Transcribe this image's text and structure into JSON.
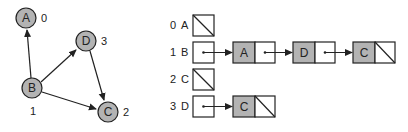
{
  "graph": {
    "nodes": [
      {
        "id": "A",
        "index": "0",
        "cx": 26,
        "cy": 18
      },
      {
        "id": "B",
        "index": "1",
        "cx": 32,
        "cy": 88
      },
      {
        "id": "C",
        "index": "2",
        "cx": 108,
        "cy": 112
      },
      {
        "id": "D",
        "index": "3",
        "cx": 86,
        "cy": 41
      }
    ],
    "edges": [
      {
        "from": "B",
        "to": "A"
      },
      {
        "from": "B",
        "to": "D"
      },
      {
        "from": "B",
        "to": "C"
      },
      {
        "from": "D",
        "to": "C"
      }
    ],
    "index_labels": {
      "A": "0",
      "B": "1",
      "C": "2",
      "D": "3"
    }
  },
  "adjacency_list": {
    "rows": [
      {
        "index": "0",
        "vertex": "A",
        "neighbors": []
      },
      {
        "index": "1",
        "vertex": "B",
        "neighbors": [
          "A",
          "D",
          "C"
        ]
      },
      {
        "index": "2",
        "vertex": "C",
        "neighbors": []
      },
      {
        "index": "3",
        "vertex": "D",
        "neighbors": [
          "C"
        ]
      }
    ]
  },
  "colors": {
    "node_fill": "#b3b3b3",
    "stroke": "#222222",
    "box_fill": "#ffffff"
  }
}
